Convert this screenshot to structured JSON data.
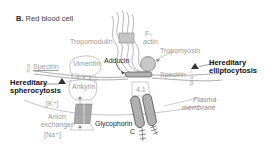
{
  "title": {
    "letter": "B.",
    "text": "Red blood cell"
  },
  "labels": {
    "tropomodulin": "Tropomodulin",
    "f_actin_1": "F-",
    "f_actin_2": "actin",
    "tropomyosin": "Tropomyosin",
    "adducin": "Adducin",
    "vimentin": "Vimentin",
    "spectrin_left": "Spectrin",
    "spectrin_right": "Spectrin",
    "alpha": "α",
    "beta": "β",
    "ankyrin": "Ankyrin",
    "protein_41": "4.1",
    "k_ion": "[K⁺]",
    "na_ion": "[Na⁺]",
    "anion_exchanger_1": "Anion",
    "anion_exchanger_2": "exchanger",
    "glycophorin_1": "Glycophorin",
    "glycophorin_2": "C",
    "plasma_membrane_1": "Plasma",
    "plasma_membrane_2": "membrane"
  },
  "diseases": {
    "spherocytosis_1": "Hereditary",
    "spherocytosis_2": "spherocytosis",
    "elliptocytosis_1": "Hereditary",
    "elliptocytosis_2": "elliptocytosis"
  },
  "colors": {
    "protein_fill": "#b8b8b8",
    "line": "#8a8a8a",
    "dark_line": "#222222",
    "label_gray": "#9a9a9a"
  }
}
